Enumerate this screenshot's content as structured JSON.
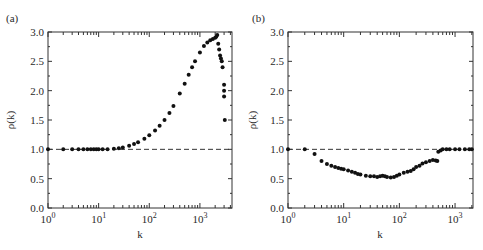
{
  "chart_data": [
    {
      "type": "scatter",
      "panel_label": "(a)",
      "xlabel": "k",
      "ylabel": "ρ(k)",
      "xscale": "log",
      "xlim": [
        1,
        4300
      ],
      "ylim": [
        0,
        3.0
      ],
      "xticks": [
        {
          "value": 1,
          "base": "10",
          "exp": "0"
        },
        {
          "value": 10,
          "base": "10",
          "exp": "1"
        },
        {
          "value": 100,
          "base": "10",
          "exp": "2"
        },
        {
          "value": 1000,
          "base": "10",
          "exp": "3"
        }
      ],
      "yticks": [
        "0.0",
        "0.5",
        "1.0",
        "1.5",
        "2.0",
        "2.5",
        "3.0"
      ],
      "yticks_values": [
        0,
        0.5,
        1.0,
        1.5,
        2.0,
        2.5,
        3.0
      ],
      "reference_line": {
        "y": 1.0,
        "style": "dashed"
      },
      "series": [
        {
          "name": "rho",
          "x": [
            1,
            2,
            3,
            4,
            5,
            6,
            7,
            8,
            9,
            10,
            12,
            15,
            20,
            25,
            30,
            40,
            50,
            60,
            80,
            100,
            130,
            160,
            200,
            250,
            300,
            400,
            500,
            600,
            700,
            800,
            1000,
            1200,
            1400,
            1600,
            1800,
            2000,
            2100,
            2200,
            2300,
            2400,
            2500,
            2600,
            2700,
            2800,
            3000,
            3000,
            3000,
            3100
          ],
          "y": [
            1.0,
            1.0,
            1.0,
            1.0,
            1.0,
            1.0,
            1.0,
            1.0,
            1.0,
            1.0,
            1.0,
            1.0,
            1.01,
            1.02,
            1.03,
            1.06,
            1.09,
            1.12,
            1.18,
            1.24,
            1.32,
            1.4,
            1.5,
            1.62,
            1.74,
            1.95,
            2.12,
            2.27,
            2.4,
            2.5,
            2.65,
            2.76,
            2.82,
            2.86,
            2.88,
            2.9,
            2.92,
            2.95,
            2.8,
            2.7,
            2.6,
            2.55,
            2.5,
            2.4,
            2.1,
            2.0,
            1.9,
            1.5
          ]
        }
      ]
    },
    {
      "type": "scatter",
      "panel_label": "(b)",
      "xlabel": "k",
      "ylabel": "ρ(k)",
      "xscale": "log",
      "xlim": [
        1,
        2100
      ],
      "ylim": [
        0,
        3.0
      ],
      "xticks": [
        {
          "value": 1,
          "base": "10",
          "exp": "0"
        },
        {
          "value": 10,
          "base": "10",
          "exp": "1"
        },
        {
          "value": 100,
          "base": "10",
          "exp": "2"
        },
        {
          "value": 1000,
          "base": "10",
          "exp": "3"
        }
      ],
      "yticks": [
        "0.0",
        "0.5",
        "1.0",
        "1.5",
        "2.0",
        "2.5",
        "3.0"
      ],
      "yticks_values": [
        0,
        0.5,
        1.0,
        1.5,
        2.0,
        2.5,
        3.0
      ],
      "reference_line": {
        "y": 1.0,
        "style": "dashed"
      },
      "series": [
        {
          "name": "rho",
          "x": [
            1,
            2,
            3,
            4,
            5,
            6,
            7,
            8,
            9,
            10,
            12,
            14,
            16,
            18,
            20,
            25,
            30,
            35,
            40,
            45,
            50,
            55,
            60,
            70,
            80,
            90,
            100,
            120,
            140,
            160,
            180,
            200,
            230,
            260,
            300,
            350,
            400,
            450,
            480,
            500,
            550,
            600,
            700,
            800,
            1000,
            1200,
            1500,
            1800,
            2000
          ],
          "y": [
            1.0,
            1.0,
            0.92,
            0.8,
            0.75,
            0.72,
            0.7,
            0.68,
            0.67,
            0.66,
            0.64,
            0.62,
            0.6,
            0.58,
            0.57,
            0.55,
            0.54,
            0.54,
            0.53,
            0.54,
            0.55,
            0.54,
            0.53,
            0.52,
            0.53,
            0.55,
            0.57,
            0.6,
            0.62,
            0.63,
            0.66,
            0.7,
            0.72,
            0.76,
            0.78,
            0.8,
            0.82,
            0.81,
            0.8,
            0.96,
            0.98,
            1.0,
            1.0,
            1.0,
            1.0,
            1.0,
            1.0,
            1.0,
            1.0
          ]
        }
      ]
    }
  ]
}
